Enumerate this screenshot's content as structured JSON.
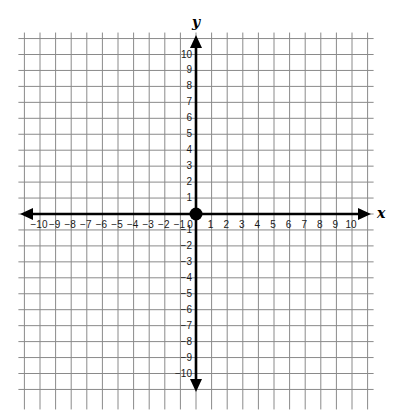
{
  "diagram": {
    "type": "coordinate-plane",
    "x_axis": {
      "label": "x",
      "min": -10,
      "max": 10,
      "step": 1
    },
    "y_axis": {
      "label": "y",
      "min": -10,
      "max": 10,
      "step": 1
    },
    "grid": {
      "extent": 11,
      "color": "#8a8a8a"
    },
    "origin_point": {
      "x": 0,
      "y": 0,
      "color": "#000000"
    },
    "x_tick_labels": [
      "−10",
      "−9",
      "−8",
      "−7",
      "−6",
      "−5",
      "−4",
      "−3",
      "−2",
      "−1",
      "0",
      "1",
      "2",
      "3",
      "4",
      "5",
      "6",
      "7",
      "8",
      "9",
      "10"
    ],
    "y_tick_labels": [
      "10",
      "9",
      "8",
      "7",
      "6",
      "5",
      "4",
      "3",
      "2",
      "1",
      "−1",
      "−2",
      "−3",
      "−4",
      "−5",
      "−6",
      "−7",
      "−8",
      "−9",
      "−10"
    ],
    "colors": {
      "axis": "#000000",
      "background": "#ffffff",
      "text": "#1a1a1a"
    }
  }
}
